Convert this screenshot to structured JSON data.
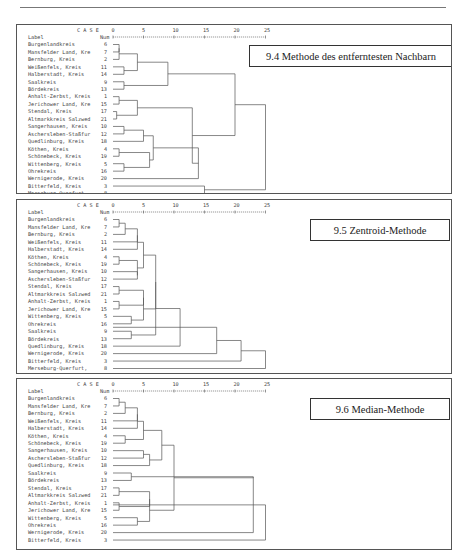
{
  "page": {
    "header_fragment": "y ..."
  },
  "chart_data": [
    {
      "type": "dendrogram",
      "title": "9.4 Methode des entferntesten Nachbarn",
      "header": {
        "case": "C A S E",
        "label": "Label",
        "num": "Num"
      },
      "axis_ticks": [
        0,
        5,
        10,
        15,
        20,
        25
      ],
      "xlim": [
        0,
        25
      ],
      "leaves": [
        {
          "label": "Burgenlandkreis",
          "num": 6
        },
        {
          "label": "Mansfelder Land, Kre",
          "num": 7
        },
        {
          "label": "Bernburg, Kreis",
          "num": 2
        },
        {
          "label": "Weißenfels, Kreis",
          "num": 11
        },
        {
          "label": "Halberstadt, Kreis",
          "num": 14
        },
        {
          "label": "Saalkreis",
          "num": 9
        },
        {
          "label": "Bördekreis",
          "num": 13
        },
        {
          "label": "Anhalt-Zerbst, Kreis",
          "num": 1
        },
        {
          "label": "Jerichower Land, Kre",
          "num": 15
        },
        {
          "label": "Stendal, Kreis",
          "num": 17
        },
        {
          "label": "Altmarkkreis Salzwed",
          "num": 21
        },
        {
          "label": "Sangerhausen, Kreis",
          "num": 10
        },
        {
          "label": "Aschersleben-Staßfur",
          "num": 12
        },
        {
          "label": "Quedlinburg, Kreis",
          "num": 18
        },
        {
          "label": "Köthen, Kreis",
          "num": 4
        },
        {
          "label": "Schönebeck, Kreis",
          "num": 19
        },
        {
          "label": "Wittenberg, Kreis",
          "num": 5
        },
        {
          "label": "Ohrekreis",
          "num": 16
        },
        {
          "label": "Wernigerode, Kreis",
          "num": 20
        },
        {
          "label": "Bitterfeld, Kreis",
          "num": 3
        },
        {
          "label": "Merseburg-Querfurt,",
          "num": 8
        }
      ],
      "merges": [
        [
          0,
          1,
          1.0
        ],
        [
          3,
          4,
          1.8
        ],
        [
          21,
          2,
          1.2
        ],
        [
          5,
          6,
          1.8
        ],
        [
          7,
          8,
          1.0
        ],
        [
          9,
          10,
          0.6
        ],
        [
          11,
          12,
          1.8
        ],
        [
          14,
          15,
          1.0
        ],
        [
          16,
          17,
          1.8
        ],
        [
          22,
          23,
          4.0
        ],
        [
          25,
          26,
          4.0
        ],
        [
          27,
          13,
          5.0
        ],
        [
          28,
          29,
          6.0
        ],
        [
          24,
          30,
          9.0
        ],
        [
          32,
          18,
          14.0
        ],
        [
          31,
          33,
          13.0
        ],
        [
          34,
          35,
          0
        ],
        [
          19,
          20,
          15.0
        ],
        [
          36,
          37,
          0
        ]
      ],
      "merge_heights_note": "approximate, read from axis"
    },
    {
      "type": "dendrogram",
      "title": "9.5 Zentroid-Methode",
      "header": {
        "case": "C A S E",
        "label": "Label",
        "num": "Num"
      },
      "axis_ticks": [
        0,
        5,
        10,
        15,
        20,
        25
      ],
      "xlim": [
        0,
        25
      ],
      "leaves": [
        {
          "label": "Burgenlandkreis",
          "num": 6
        },
        {
          "label": "Mansfelder Land, Kre",
          "num": 7
        },
        {
          "label": "Bernburg, Kreis",
          "num": 2
        },
        {
          "label": "Weißenfels, Kreis",
          "num": 11
        },
        {
          "label": "Halberstadt, Kreis",
          "num": 14
        },
        {
          "label": "Köthen, Kreis",
          "num": 4
        },
        {
          "label": "Schönebeck, Kreis",
          "num": 19
        },
        {
          "label": "Sangerhausen, Kreis",
          "num": 10
        },
        {
          "label": "Aschersleben-Staßfur",
          "num": 12
        },
        {
          "label": "Stendal, Kreis",
          "num": 17
        },
        {
          "label": "Altmarkkreis Salzwed",
          "num": 21
        },
        {
          "label": "Anhalt-Zerbst, Kreis",
          "num": 1
        },
        {
          "label": "Jerichower Land, Kre",
          "num": 15
        },
        {
          "label": "Wittenberg, Kreis",
          "num": 5
        },
        {
          "label": "Ohrekreis",
          "num": 16
        },
        {
          "label": "Saalkreis",
          "num": 9
        },
        {
          "label": "Bördekreis",
          "num": 13
        },
        {
          "label": "Quedlinburg, Kreis",
          "num": 18
        },
        {
          "label": "Wernigerode, Kreis",
          "num": 20
        },
        {
          "label": "Bitterfeld, Kreis",
          "num": 3
        },
        {
          "label": "Merseburg-Querfurt,",
          "num": 8
        }
      ]
    },
    {
      "type": "dendrogram",
      "title": "9.6 Median-Methode",
      "header": {
        "case": "C A S E",
        "label": "Label",
        "num": "Num"
      },
      "axis_ticks": [
        0,
        5,
        10,
        15,
        20,
        25
      ],
      "xlim": [
        0,
        25
      ],
      "leaves": [
        {
          "label": "Burgenlandkreis",
          "num": 6
        },
        {
          "label": "Mansfelder Land, Kre",
          "num": 7
        },
        {
          "label": "Bernburg, Kreis",
          "num": 2
        },
        {
          "label": "Weißenfels, Kreis",
          "num": 11
        },
        {
          "label": "Halberstadt, Kreis",
          "num": 14
        },
        {
          "label": "Köthen, Kreis",
          "num": 4
        },
        {
          "label": "Schönebeck, Kreis",
          "num": 19
        },
        {
          "label": "Sangerhausen, Kreis",
          "num": 10
        },
        {
          "label": "Aschersleben-Staßfur",
          "num": 12
        },
        {
          "label": "Quedlinburg, Kreis",
          "num": 18
        },
        {
          "label": "Saalkreis",
          "num": 9
        },
        {
          "label": "Bördekreis",
          "num": 13
        },
        {
          "label": "Stendal, Kreis",
          "num": 17
        },
        {
          "label": "Altmarkkreis Salzwed",
          "num": 21
        },
        {
          "label": "Anhalt-Zerbst, Kreis",
          "num": 1
        },
        {
          "label": "Jerichower Land, Kre",
          "num": 15
        },
        {
          "label": "Wittenberg, Kreis",
          "num": 5
        },
        {
          "label": "Ohrekreis",
          "num": 16
        },
        {
          "label": "Wernigerode, Kreis",
          "num": 20
        },
        {
          "label": "Bitterfeld, Kreis",
          "num": 3
        }
      ]
    }
  ],
  "trees": [
    {
      "links": [
        {
          "rows": [
            0,
            1
          ],
          "h": 1.0
        },
        {
          "rows": [
            0.5,
            2
          ],
          "h": 1.0
        },
        {
          "rows": [
            3,
            4
          ],
          "h": 1.8
        },
        {
          "rows": [
            1.25,
            3.5
          ],
          "h": 4.0
        },
        {
          "rows": [
            5,
            6
          ],
          "h": 1.8
        },
        {
          "rows": [
            2.375,
            5.5
          ],
          "h": 9.0
        },
        {
          "rows": [
            7,
            8
          ],
          "h": 1.0
        },
        {
          "rows": [
            9,
            10
          ],
          "h": 0.6
        },
        {
          "rows": [
            7.5,
            9.5
          ],
          "h": 4.0
        },
        {
          "rows": [
            11,
            12
          ],
          "h": 1.8
        },
        {
          "rows": [
            11.5,
            13
          ],
          "h": 5.0
        },
        {
          "rows": [
            14,
            15
          ],
          "h": 1.0
        },
        {
          "rows": [
            16,
            17
          ],
          "h": 1.8
        },
        {
          "rows": [
            14.5,
            16.5
          ],
          "h": 6.0
        },
        {
          "rows": [
            12.25,
            15.5
          ],
          "h": 6.6
        },
        {
          "rows": [
            13.875,
            18
          ],
          "h": 14.0
        },
        {
          "rows": [
            8.5,
            15.94
          ],
          "h": 13.0
        },
        {
          "rows": [
            3.94,
            12.22
          ],
          "h": 20.0
        },
        {
          "rows": [
            19,
            20
          ],
          "h": 15.0
        },
        {
          "rows": [
            8.08,
            19.5
          ],
          "h": 25.0
        }
      ]
    },
    {
      "links": [
        {
          "rows": [
            0,
            1
          ],
          "h": 1.0
        },
        {
          "rows": [
            0.5,
            2
          ],
          "h": 2.0
        },
        {
          "rows": [
            1.25,
            3
          ],
          "h": 4.0
        },
        {
          "rows": [
            2.125,
            4
          ],
          "h": 4.0
        },
        {
          "rows": [
            5,
            6
          ],
          "h": 1.0
        },
        {
          "rows": [
            7,
            8
          ],
          "h": 4.0
        },
        {
          "rows": [
            5.5,
            7.5
          ],
          "h": 4.0
        },
        {
          "rows": [
            3.06,
            6.5
          ],
          "h": 5.0
        },
        {
          "rows": [
            9,
            10
          ],
          "h": 1.0
        },
        {
          "rows": [
            11,
            12
          ],
          "h": 1.0
        },
        {
          "rows": [
            9.5,
            11.5
          ],
          "h": 5.0
        },
        {
          "rows": [
            13,
            14
          ],
          "h": 3.0
        },
        {
          "rows": [
            10.5,
            13.5
          ],
          "h": 5.0
        },
        {
          "rows": [
            4.78,
            12.0
          ],
          "h": 7.0
        },
        {
          "rows": [
            15,
            16
          ],
          "h": 3.0
        },
        {
          "rows": [
            8.39,
            15.5
          ],
          "h": 7.0
        },
        {
          "rows": [
            11.95,
            17
          ],
          "h": 11.0
        },
        {
          "rows": [
            14.47,
            18
          ],
          "h": 17.0
        },
        {
          "rows": [
            16.24,
            19
          ],
          "h": 21.0
        },
        {
          "rows": [
            17.62,
            20
          ],
          "h": 25.0
        }
      ]
    },
    {
      "links": [
        {
          "rows": [
            0,
            1
          ],
          "h": 1.0
        },
        {
          "rows": [
            0.5,
            2
          ],
          "h": 2.0
        },
        {
          "rows": [
            1.25,
            3
          ],
          "h": 4.0
        },
        {
          "rows": [
            2.125,
            4
          ],
          "h": 4.0
        },
        {
          "rows": [
            5,
            6
          ],
          "h": 2.0
        },
        {
          "rows": [
            3.06,
            5.5
          ],
          "h": 5.0
        },
        {
          "rows": [
            7,
            8
          ],
          "h": 5.0
        },
        {
          "rows": [
            7.5,
            9
          ],
          "h": 6.0
        },
        {
          "rows": [
            4.28,
            8.25
          ],
          "h": 8.0
        },
        {
          "rows": [
            10,
            11
          ],
          "h": 3.0
        },
        {
          "rows": [
            12,
            13
          ],
          "h": 1.0
        },
        {
          "rows": [
            14,
            15
          ],
          "h": 1.0
        },
        {
          "rows": [
            12.5,
            14.5
          ],
          "h": 6.0
        },
        {
          "rows": [
            16,
            17
          ],
          "h": 4.0
        },
        {
          "rows": [
            13.5,
            16.5
          ],
          "h": 6.0
        },
        {
          "rows": [
            6.27,
            15.0
          ],
          "h": 10.0
        },
        {
          "rows": [
            10.5,
            10.64
          ],
          "h": 23.0
        },
        {
          "rows": [
            10.57,
            18
          ],
          "h": 23.0
        },
        {
          "rows": [
            14.28,
            19
          ],
          "h": 25.0
        }
      ]
    }
  ]
}
